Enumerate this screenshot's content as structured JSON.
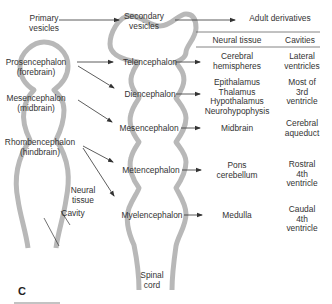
{
  "headers": {
    "primary": "Primary\nvesicles",
    "secondary": "Secondary\nvesicles",
    "adult": "Adult derivatives"
  },
  "table": {
    "col_neural": "Neural tissue",
    "col_cavities": "Cavities",
    "rows": [
      {
        "secondary": "Telencephalon",
        "neural": "Cerebral\nhemispheres",
        "cavity": "Lateral\nventricles"
      },
      {
        "secondary": "Diencephalon",
        "neural": "Epithalamus\nThalamus\nHypothalamus\nNeurohypophysis",
        "cavity": "Most of\n3rd\nventricle"
      },
      {
        "secondary": "Mesencephalon",
        "neural": "Midbrain",
        "cavity": "Cerebral\naqueduct"
      },
      {
        "secondary": "Metencephalon",
        "neural": "Pons\ncerebellum",
        "cavity": "Rostral\n4th\nventricle"
      },
      {
        "secondary": "Myelencephalon",
        "neural": "Medulla",
        "cavity": "Caudal\n4th\nventricle"
      }
    ]
  },
  "primary_vesicles": [
    {
      "name": "Prosencephalon\n(forebrain)"
    },
    {
      "name": "Mesencephalon\n(midbrain)"
    },
    {
      "name": "Rhombencephalon\n(hindbrain)"
    }
  ],
  "labels": {
    "neural_tissue": "Neural\ntissue",
    "cavity": "Cavity",
    "spinal_cord": "Spinal\ncord",
    "panel": "C"
  },
  "colors": {
    "outline": "#b8b8b8",
    "inner": "#ffffff",
    "arrow": "#333333"
  }
}
